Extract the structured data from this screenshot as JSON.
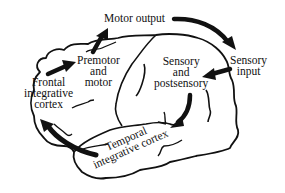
{
  "diagram": {
    "labels": {
      "motor_output": "Motor output",
      "premotor": [
        "Premotor",
        "and",
        "motor"
      ],
      "frontal": [
        "Frontal",
        "integrative",
        "cortex"
      ],
      "sensory_post": [
        "Sensory",
        "and",
        "postsensory"
      ],
      "sensory_input": [
        "Sensory",
        "input"
      ],
      "temporal": [
        "Temporal",
        "integrative cortex"
      ]
    },
    "arrows": [
      {
        "from": "Motor output",
        "to": "Sensory input",
        "shape": "curved"
      },
      {
        "from": "Sensory input",
        "to": "Sensory and postsensory",
        "shape": "straight"
      },
      {
        "from": "Sensory and postsensory",
        "to": "Temporal integrative cortex",
        "shape": "curved"
      },
      {
        "from": "Temporal integrative cortex",
        "to": "Frontal integrative cortex",
        "shape": "curved"
      },
      {
        "from": "Frontal integrative cortex",
        "to": "Premotor and motor",
        "shape": "straight"
      },
      {
        "from": "Premotor and motor",
        "to": "Motor output",
        "shape": "straight"
      }
    ],
    "colors": {
      "ink": "#111111",
      "background": "#ffffff"
    }
  }
}
